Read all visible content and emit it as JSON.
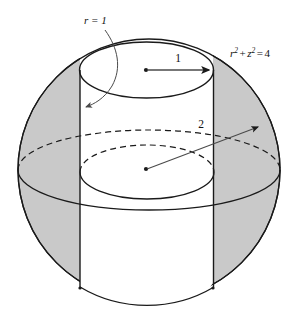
{
  "figure": {
    "background_color": "#ffffff",
    "stroke_color": "#1a1a1a",
    "shade_color": "#c9c9c9",
    "shade_color_name": "light-gray",
    "labels": {
      "cylinder_radius": {
        "text": "r = 1",
        "variable": "r",
        "relation": "=",
        "value": "1"
      },
      "sphere_equation": {
        "text": "r² + z² = 4",
        "lhs_first_base": "r",
        "lhs_first_exp": "2",
        "plus": "+",
        "lhs_second_base": "z",
        "lhs_second_exp": "2",
        "relation": "=",
        "rhs": "4"
      },
      "cylinder_radius_measure": {
        "text": "1"
      },
      "sphere_radius_measure": {
        "text": "2"
      }
    },
    "geometry": {
      "sphere": {
        "center_x": 149,
        "center_y": 170,
        "radius": 131,
        "equation": "r^2 + z^2 = 4",
        "radius_value": 2
      },
      "cylinder": {
        "center_x": 146,
        "axis_top_y": 70,
        "axis_mid_y": 175,
        "semi_width": 67,
        "ellipse_semi_minor": 28,
        "radius_value": 1
      },
      "arrows": {
        "radius_arrow": {
          "from": "cylinder top center",
          "to": "cylinder top rim right",
          "label": "1"
        },
        "sphere_radius_arrow": {
          "from": "sphere center",
          "to": "sphere surface upper-right",
          "label": "2"
        },
        "annotation_arrow": {
          "from": "r = 1 label",
          "to": "cylinder wall left",
          "label": "r = 1"
        }
      }
    }
  }
}
